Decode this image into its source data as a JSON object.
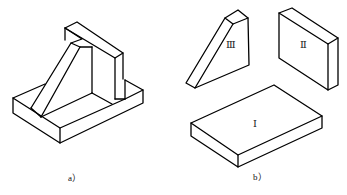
{
  "figure": {
    "subfigures": [
      {
        "id": "a",
        "caption": "a）",
        "description": "Assembled bracket: base plate, vertical back plate, triangular rib"
      },
      {
        "id": "b",
        "caption": "b）",
        "description": "Decomposed parts",
        "parts": [
          {
            "label": "Ⅲ",
            "name": "triangular rib"
          },
          {
            "label": "Ⅱ",
            "name": "vertical plate"
          },
          {
            "label": "Ⅰ",
            "name": "base plate"
          }
        ]
      }
    ]
  }
}
